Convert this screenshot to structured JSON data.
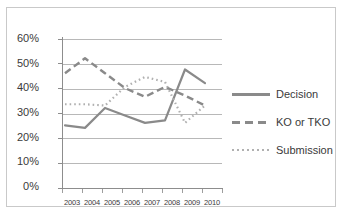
{
  "chart_data": {
    "type": "line",
    "title": "",
    "subtitle": "",
    "xlabel": "",
    "ylabel": "",
    "categories": [
      "2003",
      "2004",
      "2005",
      "2006",
      "2007",
      "2008",
      "2009",
      "2010"
    ],
    "ylim": [
      0,
      60
    ],
    "ytick_labels": [
      "0%",
      "10%",
      "20%",
      "30%",
      "40%",
      "50%",
      "60%"
    ],
    "ytick_values": [
      0,
      10,
      20,
      30,
      40,
      50,
      60
    ],
    "grid": true,
    "legend_position": "right",
    "series": [
      {
        "name": "Decision",
        "style": "solid",
        "color": "#8a8a8a",
        "values": [
          22,
          21,
          29,
          26,
          23,
          24,
          44.5,
          39
        ]
      },
      {
        "name": "KO or TKO",
        "style": "dashed",
        "color": "#8a8a8a",
        "values": [
          43,
          49,
          43,
          37,
          33.5,
          37.5,
          34,
          30
        ]
      },
      {
        "name": "Submission",
        "style": "dotted",
        "color": "#b0b0b0",
        "values": [
          30.5,
          30.5,
          30,
          37.5,
          41.5,
          39.5,
          23,
          30
        ]
      }
    ]
  },
  "legend": {
    "items": [
      {
        "label": "Decision",
        "swatch": "solid-line-swatch"
      },
      {
        "label": "KO or TKO",
        "swatch": "dashed-line-swatch"
      },
      {
        "label": "Submission",
        "swatch": "dotted-line-swatch"
      }
    ]
  },
  "colors": {
    "plot_background": "#ffffff",
    "gridline": "#b8b8b8",
    "axis": "#8d8d8d",
    "frame_border": "#c9c9c9",
    "text": "#3a3a3a"
  }
}
